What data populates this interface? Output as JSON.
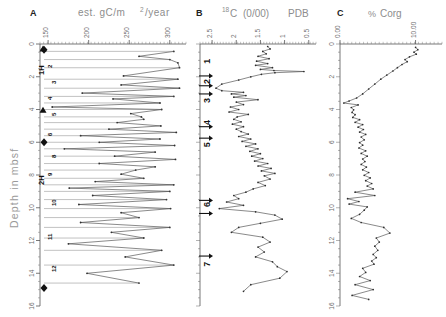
{
  "figure": {
    "depth_axis": {
      "title": "Depth in mbsf",
      "min": 0,
      "max": 16,
      "ticks": [
        0,
        2,
        4,
        6,
        8,
        10,
        12,
        14,
        16
      ],
      "tick_labels": [
        "0",
        "2",
        "4",
        "6",
        "8",
        "10",
        "12",
        "14",
        "16"
      ]
    },
    "panels": [
      {
        "letter": "A",
        "title": "est. gC/m2/year",
        "title_parts": {
          "pre": "est.  gC/m",
          "sup": "2",
          "post": "/year"
        },
        "axis_ticks": [
          150,
          200,
          250,
          300
        ],
        "axis_tick_labels": [
          "150",
          "200",
          "250",
          "300"
        ],
        "axis_min": 140,
        "axis_max": 320,
        "core_labels": [
          "1H",
          "2H"
        ],
        "sample_numbers": [
          "2",
          "3",
          "4",
          "5",
          "6",
          "8",
          "9",
          "10",
          "11",
          "12"
        ]
      },
      {
        "letter": "B",
        "title": "18C (0/00) PDB",
        "title_parts": {
          "sup": "18",
          "elem": "C",
          "paren_open": "(",
          "per": "0/00",
          "paren_close": ")",
          "std": "PDB"
        },
        "axis_ticks": [
          2.5,
          2,
          1.5,
          1,
          0.5
        ],
        "axis_tick_labels": [
          "2.5",
          "2",
          "1.5",
          "1",
          "0.5"
        ],
        "axis_min": 2.75,
        "axis_max": 0.35,
        "stage_labels": [
          "1",
          "2",
          "3",
          "4",
          "5",
          "6",
          "7"
        ]
      },
      {
        "letter": "C",
        "title": "% Corg",
        "title_parts": {
          "pct": "%",
          "name": "Corg"
        },
        "axis_ticks": [
          0.0,
          10.0
        ],
        "axis_tick_labels": [
          "0.00",
          "10.00"
        ],
        "axis_min": 0.0,
        "axis_max": 13.5
      }
    ]
  },
  "chart_data": [
    {
      "type": "line",
      "panel": "A",
      "title": "est. gC/m2/year",
      "xlabel": "est. gC/m2/year",
      "ylabel": "Depth in mbsf",
      "xlim": [
        140,
        320
      ],
      "ylim": [
        0,
        16
      ],
      "y_inverted": true,
      "grid": false,
      "x": [
        305,
        262,
        300,
        310,
        312,
        243,
        310,
        240,
        312,
        192,
        305,
        230,
        288,
        155,
        290,
        252,
        265,
        268,
        235,
        289,
        225,
        308,
        190,
        288,
        213,
        306,
        170,
        282,
        232,
        307,
        213,
        282,
        258,
        240,
        268,
        208,
        305,
        176,
        300,
        205,
        296,
        188,
        301,
        240,
        262,
        190,
        300,
        228,
        268,
        175,
        290,
        245,
        305,
        198,
        262
      ],
      "y": [
        0.45,
        0.75,
        0.95,
        1.15,
        1.45,
        1.95,
        2.15,
        2.5,
        2.7,
        3.0,
        3.2,
        3.35,
        3.6,
        3.85,
        4.0,
        4.25,
        4.45,
        4.6,
        4.8,
        5.0,
        5.2,
        5.4,
        5.6,
        5.8,
        6.0,
        6.2,
        6.4,
        6.6,
        6.85,
        7.05,
        7.3,
        7.5,
        7.7,
        7.95,
        8.2,
        8.4,
        8.6,
        8.8,
        9.0,
        9.25,
        9.5,
        9.8,
        10.05,
        10.3,
        10.6,
        10.9,
        11.2,
        11.5,
        11.85,
        12.2,
        12.6,
        13.0,
        13.5,
        14.0,
        14.6
      ],
      "markers": {
        "type": "diamond",
        "depths": [
          0.35,
          6.0,
          14.9
        ]
      },
      "triangle_markers": {
        "depths": [
          0.3,
          4.05
        ]
      }
    },
    {
      "type": "line",
      "panel": "B",
      "title": "18C (0/00) PDB",
      "xlabel": "d18O (0/00) PDB",
      "ylabel": "Depth in mbsf",
      "xlim": [
        2.75,
        0.35
      ],
      "ylim": [
        0,
        16
      ],
      "y_inverted": true,
      "x_inverted": true,
      "grid": false,
      "x": [
        1.35,
        1.3,
        1.45,
        1.38,
        1.55,
        1.32,
        1.58,
        1.35,
        1.6,
        1.25,
        1.5,
        1.22,
        0.6,
        1.2,
        1.48,
        1.7,
        1.95,
        2.3,
        2.42,
        2.3,
        1.85,
        2.1,
        1.8,
        2.05,
        1.55,
        2.0,
        1.85,
        2.12,
        1.95,
        2.15,
        1.75,
        1.98,
        2.05,
        1.9,
        2.08,
        1.85,
        2.0,
        1.9,
        1.75,
        1.95,
        1.7,
        1.88,
        1.6,
        1.8,
        1.55,
        1.72,
        1.5,
        1.68,
        1.45,
        1.62,
        1.35,
        1.55,
        1.28,
        1.48,
        1.2,
        1.42,
        1.3,
        1.55,
        1.4,
        1.65,
        1.8,
        2.05,
        1.95,
        2.2,
        1.85,
        2.35,
        1.6,
        1.2,
        1.05,
        1.5,
        1.95,
        2.1,
        1.45,
        1.3,
        1.55,
        1.42,
        1.6,
        1.25,
        1.15,
        0.95,
        1.1,
        1.7,
        1.85
      ],
      "y": [
        0.15,
        0.3,
        0.45,
        0.6,
        0.75,
        0.9,
        1.05,
        1.2,
        1.3,
        1.45,
        1.55,
        1.62,
        1.68,
        1.75,
        1.85,
        2.0,
        2.2,
        2.45,
        2.7,
        2.85,
        2.95,
        3.05,
        3.15,
        3.25,
        3.4,
        3.55,
        3.7,
        3.85,
        4.0,
        4.15,
        4.3,
        4.45,
        4.6,
        4.75,
        4.9,
        5.05,
        5.2,
        5.35,
        5.5,
        5.65,
        5.8,
        5.95,
        6.1,
        6.25,
        6.4,
        6.55,
        6.7,
        6.85,
        7.0,
        7.15,
        7.3,
        7.45,
        7.6,
        7.75,
        7.9,
        8.05,
        8.25,
        8.45,
        8.65,
        8.85,
        9.05,
        9.25,
        9.45,
        9.65,
        9.85,
        10.05,
        10.25,
        10.45,
        10.7,
        10.95,
        11.2,
        11.5,
        11.8,
        12.1,
        12.4,
        12.7,
        13.0,
        13.3,
        13.6,
        13.9,
        14.3,
        14.7,
        15.1
      ],
      "stage_arrow_depths": [
        1.95,
        2.55,
        3.05,
        5.05,
        5.75,
        9.55,
        10.35,
        12.95
      ],
      "stage_label_depths": [
        1.2,
        2.45,
        3.6,
        4.95,
        6.3,
        9.95,
        13.6
      ]
    },
    {
      "type": "line",
      "panel": "C",
      "title": "% Corg",
      "xlabel": "% Corg",
      "ylabel": "Depth in mbsf",
      "xlim": [
        0.0,
        13.5
      ],
      "ylim": [
        0,
        16
      ],
      "y_inverted": true,
      "grid": false,
      "x": [
        10.0,
        10.3,
        9.8,
        10.1,
        9.2,
        8.6,
        8.9,
        8.2,
        7.6,
        7.0,
        6.2,
        5.4,
        4.6,
        3.8,
        3.0,
        2.2,
        1.2,
        0.5,
        2.4,
        1.5,
        1.8,
        1.6,
        2.0,
        1.7,
        2.6,
        2.0,
        3.0,
        2.4,
        3.1,
        2.6,
        3.4,
        2.8,
        3.2,
        2.6,
        3.0,
        2.5,
        3.4,
        2.8,
        3.6,
        3.0,
        3.3,
        2.8,
        3.5,
        3.0,
        3.8,
        3.2,
        4.0,
        3.4,
        4.2,
        3.6,
        4.4,
        2.0,
        4.6,
        1.0,
        2.5,
        1.2,
        3.6,
        3.2,
        2.6,
        1.5,
        2.8,
        5.8,
        6.6,
        4.8,
        5.2,
        4.6,
        5.0,
        4.4,
        4.8,
        4.2,
        4.5,
        3.0,
        3.4,
        2.6,
        4.0,
        2.0,
        4.4,
        1.6,
        3.8
      ],
      "y": [
        0.2,
        0.35,
        0.5,
        0.62,
        0.78,
        0.95,
        1.08,
        1.25,
        1.45,
        1.65,
        1.9,
        2.15,
        2.45,
        2.75,
        3.05,
        3.3,
        3.48,
        3.6,
        3.72,
        3.88,
        4.02,
        4.18,
        4.32,
        4.48,
        4.62,
        4.78,
        4.92,
        5.08,
        5.22,
        5.38,
        5.52,
        5.68,
        5.85,
        6.02,
        6.18,
        6.35,
        6.52,
        6.68,
        6.85,
        7.02,
        7.18,
        7.35,
        7.52,
        7.68,
        7.85,
        8.02,
        8.18,
        8.35,
        8.52,
        8.68,
        8.85,
        9.05,
        9.25,
        9.45,
        9.62,
        9.78,
        9.95,
        10.15,
        10.4,
        10.65,
        10.9,
        11.2,
        11.55,
        11.85,
        12.1,
        12.35,
        12.6,
        12.85,
        13.05,
        13.25,
        13.45,
        13.7,
        13.95,
        14.2,
        14.45,
        14.7,
        15.0,
        15.35,
        15.6
      ]
    }
  ]
}
